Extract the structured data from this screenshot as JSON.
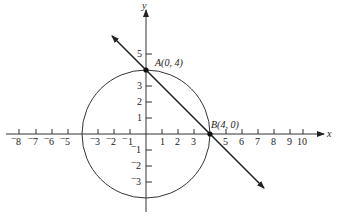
{
  "diagram": {
    "type": "coordinate-plane",
    "axes": {
      "x_label": "x",
      "y_label": "y",
      "x_ticks_negative": [
        "-8",
        "-7",
        "-6",
        "-5",
        "-3",
        "-2",
        "-1"
      ],
      "x_ticks_positive": [
        "1",
        "2",
        "3",
        "5",
        "6",
        "7",
        "8",
        "9",
        "10"
      ],
      "y_ticks_positive": [
        "1",
        "2",
        "3",
        "5"
      ],
      "y_ticks_negative": [
        "-1",
        "-2",
        "-3"
      ]
    },
    "circle": {
      "center": [
        0,
        0
      ],
      "radius": 4
    },
    "line": {
      "through": [
        [
          0,
          4
        ],
        [
          4,
          0
        ]
      ]
    },
    "points": [
      {
        "name": "A",
        "label": "A(0, 4)",
        "x": 0,
        "y": 4
      },
      {
        "name": "B",
        "label": "B(4, 0)",
        "x": 4,
        "y": 0
      }
    ]
  },
  "labels": {
    "x_axis": "x",
    "y_axis": "y",
    "point_a": "A(0, 4)",
    "point_b": "B(4, 0)",
    "xt_m8": "8",
    "xt_m7": "7",
    "xt_m6": "6",
    "xt_m5": "5",
    "xt_m3": "3",
    "xt_m2": "2",
    "xt_m1": "1",
    "xt_1": "1",
    "xt_2": "2",
    "xt_3": "3",
    "xt_5": "5",
    "xt_6": "6",
    "xt_7": "7",
    "xt_8": "8",
    "xt_9": "9",
    "xt_10": "10",
    "yt_1": "1",
    "yt_2": "2",
    "yt_3": "3",
    "yt_5": "5",
    "yt_m1": "1",
    "yt_m2": "2",
    "yt_m3": "3",
    "minus": "−"
  }
}
